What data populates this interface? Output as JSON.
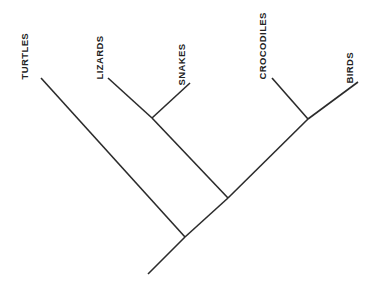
{
  "diagram": {
    "type": "cladogram",
    "title": "",
    "background_color": "#ffffff",
    "line_color": "#2b2b2b",
    "label_color": "#232323",
    "label_orientation": "rotated-90-ccw",
    "taxa": [
      {
        "id": "turtles",
        "label": "TURTLES",
        "tip_x": 41,
        "tip_y": 78
      },
      {
        "id": "lizards",
        "label": "LIZARDS",
        "tip_x": 108,
        "tip_y": 78
      },
      {
        "id": "snakes",
        "label": "SNAKES",
        "tip_x": 190,
        "tip_y": 83
      },
      {
        "id": "crocodiles",
        "label": "CROCODILES",
        "tip_x": 272,
        "tip_y": 78
      },
      {
        "id": "birds",
        "label": "BIRDS",
        "tip_x": 358,
        "tip_y": 82
      }
    ],
    "nodes": [
      {
        "id": "root",
        "x": 185,
        "y": 237
      },
      {
        "id": "middle",
        "x": 228,
        "y": 198
      },
      {
        "id": "squamates",
        "x": 152,
        "y": 118
      },
      {
        "id": "archosaurs",
        "x": 308,
        "y": 119
      },
      {
        "id": "root-stem-end",
        "x": 148,
        "y": 274
      }
    ],
    "branches": [
      {
        "id": "root-stem",
        "from": "root-stem-end",
        "to": "root",
        "x1": 148,
        "y1": 274,
        "x2": 185,
        "y2": 237
      },
      {
        "id": "root-to-turtles",
        "from": "root",
        "to": "turtles",
        "x1": 185,
        "y1": 237,
        "x2": 41,
        "y2": 78
      },
      {
        "id": "root-to-middle",
        "from": "root",
        "to": "middle",
        "x1": 185,
        "y1": 237,
        "x2": 228,
        "y2": 198
      },
      {
        "id": "middle-to-squamates",
        "from": "middle",
        "to": "squamates",
        "x1": 228,
        "y1": 198,
        "x2": 152,
        "y2": 118
      },
      {
        "id": "middle-to-archosaurs",
        "from": "middle",
        "to": "archosaurs",
        "x1": 228,
        "y1": 198,
        "x2": 308,
        "y2": 119
      },
      {
        "id": "squamates-to-lizards",
        "from": "squamates",
        "to": "lizards",
        "x1": 152,
        "y1": 118,
        "x2": 108,
        "y2": 78
      },
      {
        "id": "squamates-to-snakes",
        "from": "squamates",
        "to": "snakes",
        "x1": 152,
        "y1": 118,
        "x2": 190,
        "y2": 83
      },
      {
        "id": "archosaurs-to-crocodiles",
        "from": "archosaurs",
        "to": "crocodiles",
        "x1": 308,
        "y1": 119,
        "x2": 272,
        "y2": 78
      },
      {
        "id": "archosaurs-to-birds",
        "from": "archosaurs",
        "to": "birds",
        "x1": 308,
        "y1": 119,
        "x2": 358,
        "y2": 82
      }
    ],
    "labels": [
      {
        "id": "turtles",
        "text": "TURTLES",
        "left": 29,
        "top": 70
      },
      {
        "id": "lizards",
        "text": "LIZARDS",
        "left": 104,
        "top": 70
      },
      {
        "id": "snakes",
        "text": "SNAKES",
        "left": 186,
        "top": 76
      },
      {
        "id": "crocodiles",
        "text": "CROCODILES",
        "left": 267,
        "top": 70
      },
      {
        "id": "birds",
        "text": "BIRDS",
        "left": 354,
        "top": 74
      }
    ]
  }
}
